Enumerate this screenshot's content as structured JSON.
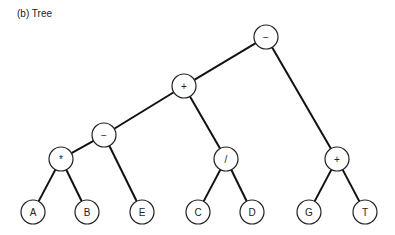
{
  "title": "(b) Tree",
  "nodes": [
    {
      "id": "root",
      "label": "−",
      "x": 266,
      "y": 37
    },
    {
      "id": "plus1",
      "label": "+",
      "x": 184,
      "y": 86
    },
    {
      "id": "minus2",
      "label": "−",
      "x": 104,
      "y": 135
    },
    {
      "id": "mul",
      "label": "*",
      "x": 61,
      "y": 159
    },
    {
      "id": "A",
      "label": "A",
      "x": 33,
      "y": 212
    },
    {
      "id": "B",
      "label": "B",
      "x": 87,
      "y": 212
    },
    {
      "id": "E",
      "label": "E",
      "x": 142,
      "y": 212
    },
    {
      "id": "div",
      "label": "/",
      "x": 226,
      "y": 159
    },
    {
      "id": "C",
      "label": "C",
      "x": 198,
      "y": 212
    },
    {
      "id": "D",
      "label": "D",
      "x": 252,
      "y": 212
    },
    {
      "id": "plus2",
      "label": "+",
      "x": 337,
      "y": 159
    },
    {
      "id": "G",
      "label": "G",
      "x": 309,
      "y": 212
    },
    {
      "id": "T",
      "label": "T",
      "x": 365,
      "y": 212
    }
  ],
  "edges": [
    [
      "root",
      "plus1"
    ],
    [
      "root",
      "plus2"
    ],
    [
      "plus1",
      "minus2"
    ],
    [
      "plus1",
      "div"
    ],
    [
      "minus2",
      "mul"
    ],
    [
      "minus2",
      "E"
    ],
    [
      "mul",
      "A"
    ],
    [
      "mul",
      "B"
    ],
    [
      "div",
      "C"
    ],
    [
      "div",
      "D"
    ],
    [
      "plus2",
      "G"
    ],
    [
      "plus2",
      "T"
    ]
  ]
}
